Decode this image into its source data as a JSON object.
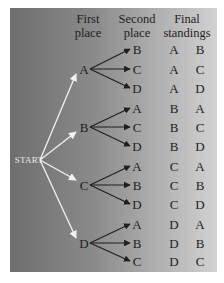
{
  "headers": {
    "first": [
      "First",
      "place"
    ],
    "second": [
      "Second",
      "place"
    ],
    "final": [
      "Final",
      "standings"
    ]
  },
  "start_label": "START",
  "colors": {
    "panel_dark": "#6e6e6e",
    "panel_light": "#d2d2d2",
    "start_arrows": "#f2f2f2",
    "branch_arrows": "#1e1e1e",
    "text": "#1e1e1e"
  },
  "tree": [
    {
      "first": "A",
      "second": [
        "B",
        "C",
        "D"
      ]
    },
    {
      "first": "B",
      "second": [
        "A",
        "C",
        "D"
      ]
    },
    {
      "first": "C",
      "second": [
        "A",
        "B",
        "D"
      ]
    },
    {
      "first": "D",
      "second": [
        "A",
        "B",
        "C"
      ]
    }
  ],
  "standings": [
    [
      "A",
      "B"
    ],
    [
      "A",
      "C"
    ],
    [
      "A",
      "D"
    ],
    [
      "B",
      "A"
    ],
    [
      "B",
      "C"
    ],
    [
      "B",
      "D"
    ],
    [
      "C",
      "A"
    ],
    [
      "C",
      "B"
    ],
    [
      "C",
      "D"
    ],
    [
      "D",
      "A"
    ],
    [
      "D",
      "B"
    ],
    [
      "D",
      "C"
    ]
  ]
}
